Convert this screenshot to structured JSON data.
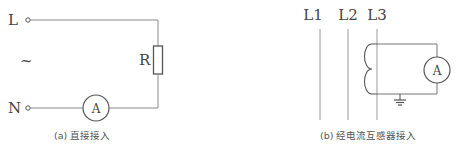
{
  "diagram_a": {
    "label_L": "L",
    "label_N": "N",
    "ac_symbol": "~",
    "resistor_label": "R",
    "ammeter_label": "A",
    "caption": "(a) 直接接入"
  },
  "diagram_b": {
    "phase_labels": [
      "L1",
      "L2",
      "L3"
    ],
    "ammeter_label": "A",
    "caption": "(b) 经电流互感器接入"
  },
  "colors": {
    "line": "#8a8a8a",
    "component": "#555555",
    "text": "#444444"
  }
}
